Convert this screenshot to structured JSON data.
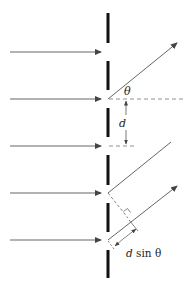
{
  "diagram": {
    "labels": {
      "theta": "θ",
      "spacing": "d",
      "path_difference_d": "d",
      "path_difference_rest": " sin θ"
    },
    "colors": {
      "barrier": "#111111",
      "rays": "#555555",
      "dashed": "#777777",
      "background": "#ffffff"
    },
    "incident_rays_count": 5,
    "slit_bars_count": 6,
    "diffracted_rays_count": 3
  }
}
